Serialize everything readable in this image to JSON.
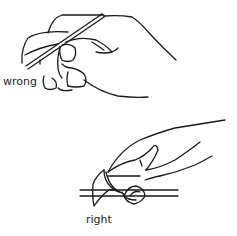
{
  "figure": {
    "panels": [
      {
        "id": "wrong",
        "label": "wrong",
        "description": "hand gripping a thin rod/line with thumb wrapped over it"
      },
      {
        "id": "right",
        "label": "right",
        "description": "hand pinching a line between thumb and fingertips"
      }
    ]
  },
  "colors": {
    "ink": "#1a1a1a",
    "background": "#ffffff"
  }
}
